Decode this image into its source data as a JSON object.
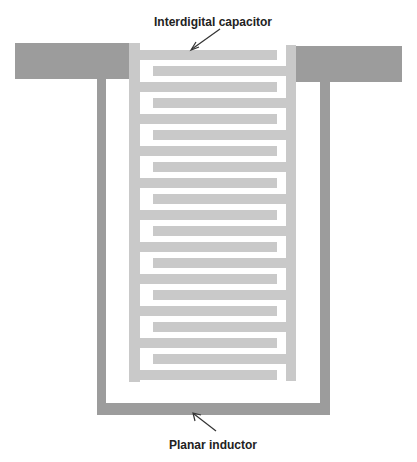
{
  "labels": {
    "capacitor": "Interdigital capacitor",
    "inductor": "Planar inductor"
  },
  "colors": {
    "inductor": "#9c9c9c",
    "capacitor": "#c9c9c9",
    "arrow": "#333333",
    "background": "#ffffff"
  },
  "capacitor": {
    "left_fingers": 11,
    "right_fingers": 10
  }
}
